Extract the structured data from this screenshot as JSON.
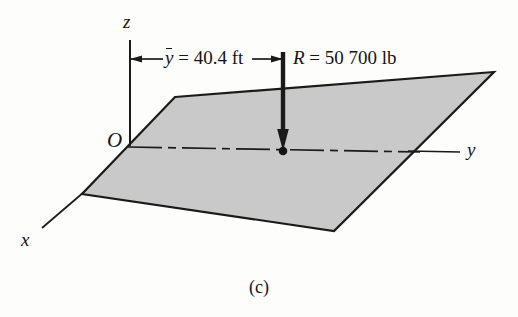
{
  "figure": {
    "caption": "(c)",
    "axes": {
      "z_label": "z",
      "y_label": "y",
      "x_label": "x",
      "origin_label": "O"
    },
    "dimension": {
      "symbol": "y",
      "overbar": true,
      "equals": "=",
      "value": "40.4",
      "unit": "ft",
      "full_text": "ȳ = 40.4 ft"
    },
    "force": {
      "symbol": "R",
      "equals": "=",
      "value": "50 700",
      "unit": "lb",
      "full_text": "R = 50 700 lb"
    },
    "colors": {
      "plane_fill": "#c9c9c9",
      "outline": "#1a1a1a",
      "background": "#fdfdfc"
    },
    "geometry": {
      "plane_vertices": "175,97 494,72 334,231 82,194",
      "z_axis": "130,40 130,146",
      "y_axis_visible_end": "460,152",
      "x_axis_end": "42,228",
      "force_arrow_top": "283,52",
      "force_arrow_tip": "283,150",
      "application_point": "283,151"
    }
  }
}
